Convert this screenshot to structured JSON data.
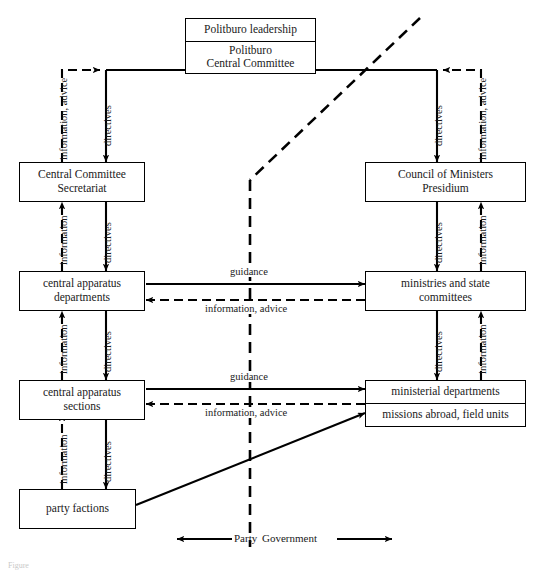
{
  "figure": {
    "caption": "Figure",
    "divider_label_left": "Party",
    "divider_label_right": "Government"
  },
  "nodes": {
    "politburo_leadership": "Politburo leadership",
    "politburo_cc_line1": "Politburo",
    "politburo_cc_line2": "Central Committee",
    "cc_secretariat_line1": "Central Committee",
    "cc_secretariat_line2": "Secretariat",
    "council_ministers_line1": "Council of Ministers",
    "council_ministers_line2": "Presidium",
    "central_departments_line1": "central apparatus",
    "central_departments_line2": "departments",
    "ministries_line1": "ministries and state",
    "ministries_line2": "committees",
    "central_sections_line1": "central apparatus",
    "central_sections_line2": "sections",
    "ministerial_departments": "ministerial departments",
    "missions_abroad": "missions abroad, field units",
    "party_factions": "party factions"
  },
  "edge_labels": {
    "left_info_advice_top": "information, advice",
    "left_directives_top": "directives",
    "right_directives_top": "directives",
    "right_info_advice_top": "information, advice",
    "left_information_2": "information",
    "left_directives_2": "directives",
    "right_directives_2": "directives",
    "right_information_2": "information",
    "left_information_3": "information",
    "left_directives_3": "directives",
    "right_directives_3": "directives",
    "right_information_3": "information",
    "left_information_4": "information",
    "left_directives_4": "directives",
    "guidance_upper": "guidance",
    "info_advice_upper": "information, advice",
    "guidance_lower": "guidance",
    "info_advice_lower": "information, advice"
  },
  "style": {
    "line_color": "#000000",
    "background": "#ffffff"
  }
}
